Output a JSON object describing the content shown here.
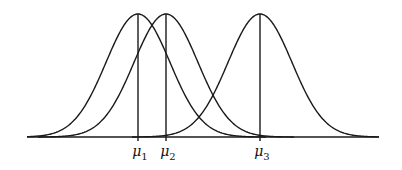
{
  "figure": {
    "baseline": {
      "y": 137,
      "x_start": 27,
      "x_end": 379
    },
    "peak_y": 14,
    "sigma_px": 32,
    "stroke_color": "#1a1a1a",
    "curves": [
      {
        "name": "distribution-1",
        "mean_x": 138,
        "label_symbol": "μ",
        "label_sub": "1"
      },
      {
        "name": "distribution-2",
        "mean_x": 166,
        "label_symbol": "μ",
        "label_sub": "2"
      },
      {
        "name": "distribution-3",
        "mean_x": 260,
        "label_symbol": "μ",
        "label_sub": "3"
      }
    ]
  }
}
